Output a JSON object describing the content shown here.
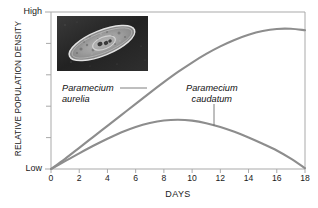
{
  "figure": {
    "title": "",
    "axis_y_title": "RELATIVE POPULATION DENSITY",
    "axis_x_title": "DAYS",
    "y_high_label": "High",
    "y_low_label": "Low",
    "curve_color": "#8d8d8d",
    "axis_color": "#a9a9a9",
    "text_color": "#1b1b1b",
    "inset_bg_color": "#2a2a2a",
    "inset_cell_color": "#c9c9c9",
    "inset_name": "paramecium-micrograph"
  },
  "annotations": [
    {
      "name": "paramecium-aurelia-label",
      "line1": "Paramecium",
      "line2": "aurelia"
    },
    {
      "name": "paramecium-caudatum-label",
      "line1": "Paramecium",
      "line2": "caudatum"
    }
  ],
  "chart_data": {
    "type": "line",
    "title": "",
    "xlabel": "DAYS",
    "ylabel": "RELATIVE POPULATION DENSITY",
    "xlim": [
      0,
      18
    ],
    "ylim": [
      0,
      1
    ],
    "ytick_labels": [
      "Low",
      "High"
    ],
    "ytick_values": [
      0,
      1
    ],
    "y_axis_qualitative": true,
    "grid": false,
    "legend": "inline-annotations",
    "xticks": [
      0,
      2,
      4,
      6,
      8,
      10,
      12,
      14,
      16,
      18
    ],
    "xtick_labels": [
      "0",
      "2",
      "4",
      "6",
      "8",
      "10",
      "12",
      "14",
      "16",
      "18"
    ],
    "x": [
      0,
      1,
      2,
      3,
      4,
      5,
      6,
      7,
      8,
      9,
      10,
      11,
      12,
      13,
      14,
      15,
      16,
      17,
      18
    ],
    "series": [
      {
        "name": "Paramecium aurelia",
        "color": "#8d8d8d",
        "values": [
          0.0,
          0.065,
          0.135,
          0.205,
          0.275,
          0.345,
          0.415,
          0.485,
          0.553,
          0.618,
          0.678,
          0.733,
          0.781,
          0.822,
          0.855,
          0.879,
          0.892,
          0.893,
          0.884
        ]
      },
      {
        "name": "Paramecium caudatum",
        "color": "#8d8d8d",
        "values": [
          0.0,
          0.05,
          0.1,
          0.148,
          0.193,
          0.234,
          0.268,
          0.293,
          0.309,
          0.314,
          0.308,
          0.292,
          0.268,
          0.237,
          0.201,
          0.161,
          0.118,
          0.066,
          0.005
        ]
      }
    ]
  }
}
